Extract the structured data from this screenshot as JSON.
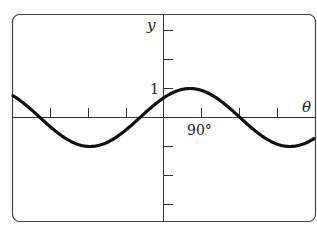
{
  "chart_data": {
    "type": "line",
    "title": "",
    "xlabel": "θ",
    "ylabel": "y",
    "x_tick_label": "90°",
    "y_tick_label": "1",
    "x_tick_step_deg": 90,
    "y_tick_step": 1,
    "xlim_deg": [
      -400,
      400
    ],
    "ylim": [
      -3,
      3
    ],
    "grid": false,
    "legend": null,
    "series": [
      {
        "name": "curve",
        "description": "sinusoid, amplitude 1, peak near θ≈64°, period ≈ 474°",
        "x": [
          -400,
          -270,
          -180,
          -90,
          -55,
          0,
          64,
          90,
          180,
          270,
          301,
          400
        ],
        "values": [
          0.77,
          -0.3,
          -1.0,
          -0.55,
          0.0,
          0.7,
          1.0,
          0.95,
          0.05,
          -0.9,
          -1.0,
          -0.7
        ]
      }
    ]
  },
  "labels": {
    "y_axis": "y",
    "x_axis": "θ",
    "one": "1",
    "ninety": "90°"
  },
  "colors": {
    "curve": "#111111",
    "axes": "#333333",
    "frame": "#444444"
  }
}
